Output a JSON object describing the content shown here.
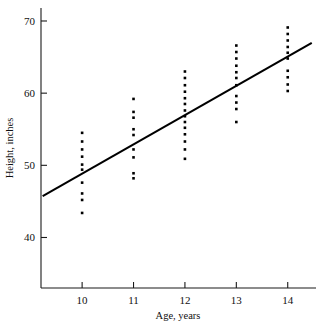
{
  "chart_data": {
    "type": "scatter",
    "title": "",
    "xlabel": "Age, years",
    "ylabel": "Height, inches",
    "xlim": [
      9.2,
      14.55
    ],
    "ylim": [
      33.0,
      71.8
    ],
    "xticks": [
      10,
      11,
      12,
      13,
      14
    ],
    "xtick_labels": [
      "10",
      "11",
      "12",
      "13",
      "14"
    ],
    "yticks": [
      40,
      50,
      60,
      70
    ],
    "ytick_labels": [
      "40",
      "50",
      "60",
      "70"
    ],
    "grid": false,
    "legend": "none",
    "marker": "square-dot",
    "marker_color": "#000000",
    "series": [
      {
        "name": "Height by age",
        "points": [
          {
            "x": 10,
            "y": 43.4
          },
          {
            "x": 10,
            "y": 45.2
          },
          {
            "x": 10,
            "y": 46.1
          },
          {
            "x": 10,
            "y": 47.6
          },
          {
            "x": 10,
            "y": 49.4
          },
          {
            "x": 10,
            "y": 50.1
          },
          {
            "x": 10,
            "y": 51.2
          },
          {
            "x": 10,
            "y": 52.2
          },
          {
            "x": 10,
            "y": 53.3
          },
          {
            "x": 10,
            "y": 54.5
          },
          {
            "x": 11,
            "y": 48.2
          },
          {
            "x": 11,
            "y": 48.9
          },
          {
            "x": 11,
            "y": 51.1
          },
          {
            "x": 11,
            "y": 52.2
          },
          {
            "x": 11,
            "y": 54.2
          },
          {
            "x": 11,
            "y": 55.0
          },
          {
            "x": 11,
            "y": 56.6
          },
          {
            "x": 11,
            "y": 57.4
          },
          {
            "x": 11,
            "y": 59.2
          },
          {
            "x": 12,
            "y": 50.9
          },
          {
            "x": 12,
            "y": 52.2
          },
          {
            "x": 12,
            "y": 53.3
          },
          {
            "x": 12,
            "y": 54.3
          },
          {
            "x": 12,
            "y": 55.2
          },
          {
            "x": 12,
            "y": 56.0
          },
          {
            "x": 12,
            "y": 56.8
          },
          {
            "x": 12,
            "y": 57.6
          },
          {
            "x": 12,
            "y": 58.5
          },
          {
            "x": 12,
            "y": 59.3
          },
          {
            "x": 12,
            "y": 60.2
          },
          {
            "x": 12,
            "y": 61.1
          },
          {
            "x": 12,
            "y": 62.1
          },
          {
            "x": 12,
            "y": 63.0
          },
          {
            "x": 13,
            "y": 56.0
          },
          {
            "x": 13,
            "y": 57.8
          },
          {
            "x": 13,
            "y": 58.7
          },
          {
            "x": 13,
            "y": 59.6
          },
          {
            "x": 13,
            "y": 61.1
          },
          {
            "x": 13,
            "y": 62.1
          },
          {
            "x": 13,
            "y": 62.9
          },
          {
            "x": 13,
            "y": 63.8
          },
          {
            "x": 13,
            "y": 64.8
          },
          {
            "x": 13,
            "y": 65.7
          },
          {
            "x": 13,
            "y": 66.6
          },
          {
            "x": 14,
            "y": 60.3
          },
          {
            "x": 14,
            "y": 61.2
          },
          {
            "x": 14,
            "y": 62.2
          },
          {
            "x": 14,
            "y": 63.1
          },
          {
            "x": 14,
            "y": 64.8
          },
          {
            "x": 14,
            "y": 65.6
          },
          {
            "x": 14,
            "y": 66.4
          },
          {
            "x": 14,
            "y": 67.3
          },
          {
            "x": 14,
            "y": 68.2
          },
          {
            "x": 14,
            "y": 69.1
          }
        ]
      }
    ],
    "fit_line": {
      "name": "least-squares line",
      "x_start": 9.25,
      "y_start": 45.8,
      "x_end": 14.45,
      "y_end": 66.9,
      "color": "#000000"
    }
  }
}
